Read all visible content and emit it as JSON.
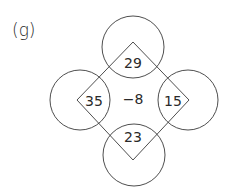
{
  "part_label": "(g)",
  "colors": {
    "stroke": "#3a3a3a",
    "text": "#2a2a2a",
    "background": "#ffffff"
  },
  "diagram": {
    "center_value": "−8",
    "corners": {
      "top": "29",
      "left": "35",
      "right": "15",
      "bottom": "23"
    },
    "circles": [
      {
        "name": "top",
        "cx": 133,
        "cy": 47,
        "r": 31
      },
      {
        "name": "left",
        "cx": 80,
        "cy": 100,
        "r": 30
      },
      {
        "name": "right",
        "cx": 188,
        "cy": 100,
        "r": 30
      },
      {
        "name": "bottom",
        "cx": 134,
        "cy": 155,
        "r": 31
      }
    ],
    "diamond_vertices": [
      [
        133,
        42
      ],
      [
        189,
        100
      ],
      [
        133,
        160
      ],
      [
        77,
        100
      ]
    ]
  }
}
